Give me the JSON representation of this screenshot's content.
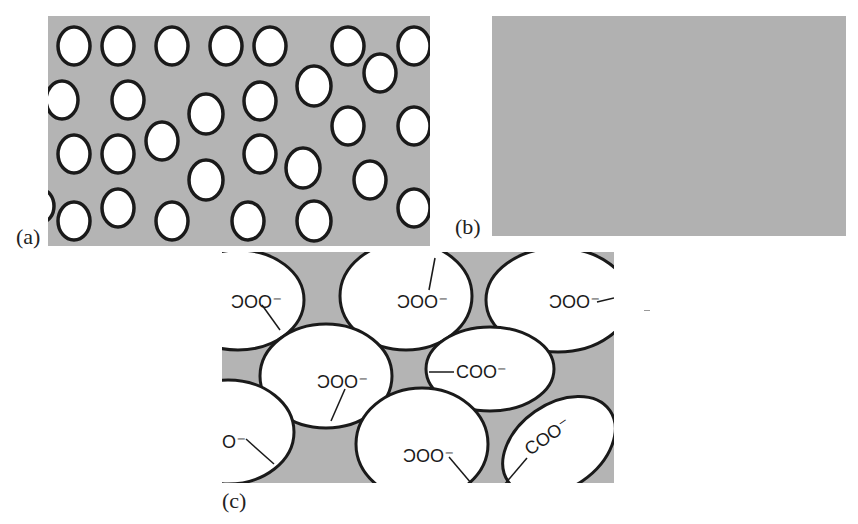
{
  "figure": {
    "panels": [
      {
        "id": "a",
        "label": "(a)",
        "description": "Dense field of small white circular particles with dark outlines dispersed in a gray matrix",
        "background_color": "#b4b4b4",
        "particle_fill": "#ffffff",
        "particle_stroke": "#1a1a1a"
      },
      {
        "id": "b",
        "label": "(b)",
        "description": "Uniform gray matrix with no particles",
        "background_color": "#b4b4b4"
      },
      {
        "id": "c",
        "label": "(c)",
        "description": "Close-up of large white ellipses in gray matrix, each labeled with a carboxylate group attached via a line",
        "background_color": "#b4b4b4",
        "group_label": "COO⁻",
        "group_label_mirrored": "⁻OOC"
      }
    ],
    "ellipse_labels": [
      "COO⁻",
      "COO⁻",
      "COO⁻",
      "COO⁻",
      "COO⁻",
      "COO⁻",
      "COO⁻",
      "COO⁻"
    ]
  }
}
